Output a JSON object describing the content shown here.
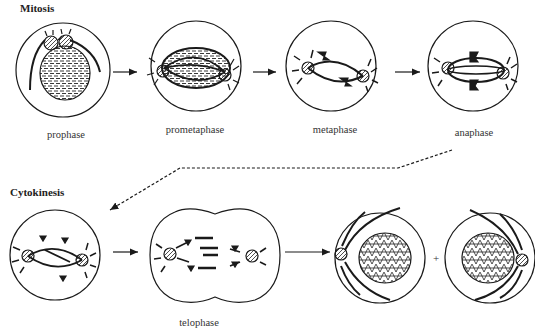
{
  "diagram": {
    "sections": {
      "mitosis": "Mitosis",
      "cytokinesis": "Cytokinesis"
    },
    "stages": [
      {
        "id": "prophase",
        "label": "prophase"
      },
      {
        "id": "prometaphase",
        "label": "prometaphase"
      },
      {
        "id": "metaphase",
        "label": "metaphase"
      },
      {
        "id": "anaphase",
        "label": "anaphase"
      },
      {
        "id": "late-anaphase",
        "label": ""
      },
      {
        "id": "telophase",
        "label": "telophase"
      },
      {
        "id": "daughter-cell-1",
        "label": ""
      },
      {
        "id": "daughter-cell-2",
        "label": ""
      }
    ],
    "plus_sign": "+",
    "colors": {
      "stroke": "#1a1a1a",
      "background": "#ffffff"
    }
  }
}
